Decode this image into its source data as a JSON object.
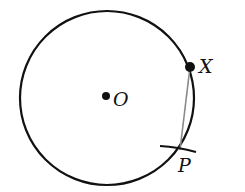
{
  "diagram": {
    "circle": {
      "cx": 107,
      "cy": 98,
      "r": 87,
      "stroke": "#111111"
    },
    "points": [
      {
        "id": "O",
        "label": "O",
        "x": 106,
        "y": 96,
        "label_x": 113,
        "label_y": 106
      },
      {
        "id": "X",
        "label": "X",
        "x": 190,
        "y": 67,
        "label_x": 199,
        "label_y": 73
      },
      {
        "id": "P",
        "label": "P",
        "x": 180,
        "y": 150,
        "label_x": 178,
        "label_y": 172
      }
    ],
    "segments": [
      {
        "from": "X",
        "to": "P",
        "stroke": "#888888"
      }
    ],
    "arc_mark": {
      "at": "P",
      "description": "compass arc crossing circle at P"
    }
  }
}
